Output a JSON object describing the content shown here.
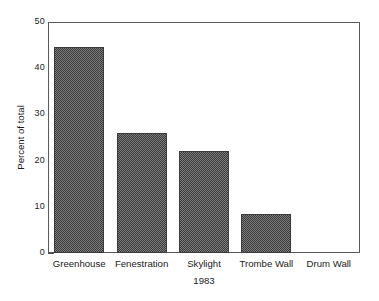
{
  "chart_data": {
    "type": "bar",
    "title": "",
    "subtitle": "",
    "categories": [
      "Greenhouse",
      "Fenestration",
      "Skylight",
      "Trombe Wall",
      "Drum Wall"
    ],
    "values": [
      44.5,
      26.0,
      22.0,
      8.5,
      0.0
    ],
    "xlabel": "1983",
    "ylabel": "Percent of total",
    "ylim": [
      0,
      50
    ],
    "y_major_ticks": [
      0,
      10,
      20,
      30,
      40,
      50
    ],
    "y_tick_labels": [
      "0",
      "10",
      "20",
      "30",
      "40",
      "50"
    ],
    "y_minor_ticks": [
      5,
      15,
      25,
      35,
      45
    ],
    "grid": false,
    "legend": null,
    "legend_position": "none",
    "series": [
      {
        "name": "Percent of total",
        "values": [
          44.5,
          26.0,
          22.0,
          8.5,
          0.0
        ]
      }
    ],
    "annotations": [],
    "colors": {
      "bar_fill": "#7d7d7d",
      "bar_pattern_dark": "#3a3a3a",
      "bar_border": "#3b3b3b",
      "axis": "#5a5a5a",
      "text": "#1a1a1a",
      "background": "#ffffff"
    }
  }
}
